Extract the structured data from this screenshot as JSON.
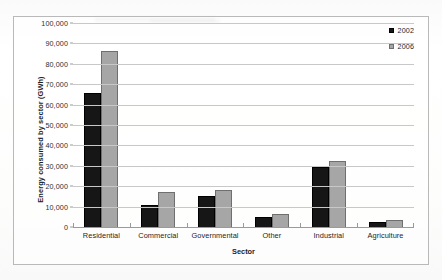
{
  "document": {
    "top_caption": ""
  },
  "chart_data": {
    "type": "bar",
    "title": "",
    "xlabel": "Sector",
    "ylabel": "Energy consumed by sector (GWh)",
    "categories": [
      "Residential",
      "Commercial",
      "Governmental",
      "Other",
      "Industrial",
      "Agriculture"
    ],
    "series": [
      {
        "name": "2002",
        "color": "#161616",
        "values": [
          65500,
          11000,
          15200,
          4700,
          29200,
          2400
        ]
      },
      {
        "name": "2006",
        "color": "#a6a6a6",
        "values": [
          86500,
          17000,
          18000,
          6300,
          32500,
          3300
        ]
      }
    ],
    "ylim": [
      0,
      100000
    ],
    "ytick_values": [
      0,
      10000,
      20000,
      30000,
      40000,
      50000,
      60000,
      70000,
      80000,
      90000,
      100000
    ],
    "ytick_labels": [
      "0",
      "10,000",
      "20,000",
      "30,000",
      "40,000",
      "50,000",
      "60,000",
      "70,000",
      "80,000",
      "90,000",
      "100,000"
    ],
    "grid": true,
    "legend_position": "top-right",
    "legend_entries": [
      "2002",
      "2006"
    ]
  }
}
